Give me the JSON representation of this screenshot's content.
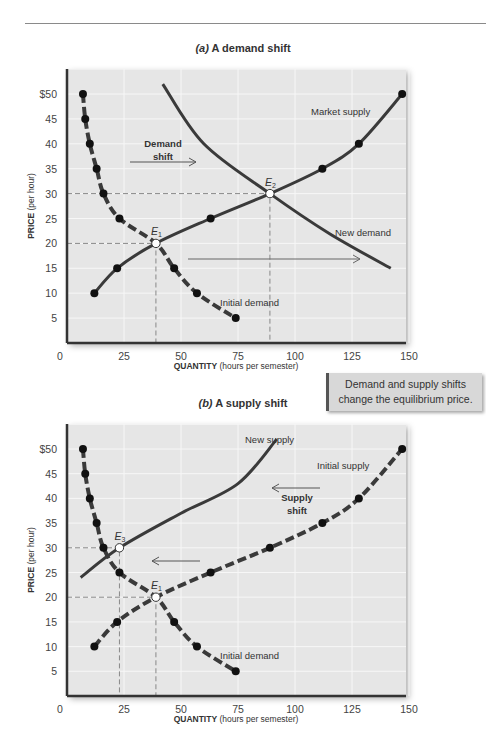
{
  "header": {
    "rule": true
  },
  "callout": {
    "line1": "Demand and supply shifts",
    "line2": "change the equilibrium price."
  },
  "panel_a": {
    "title_prefix": "(a)",
    "title": "A demand shift",
    "ylabel_bold": "PRICE",
    "ylabel_rest": "(per hour)",
    "xlabel_bold": "QUANTITY",
    "xlabel_rest": "(hours per semester)",
    "labels": {
      "market_supply": "Market supply",
      "new_demand": "New demand",
      "initial_demand": "Initial demand",
      "demand_shift_1": "Demand",
      "demand_shift_2": "shift",
      "e1": "E",
      "e1_sub": "1",
      "e2": "E",
      "e2_sub": "2"
    }
  },
  "panel_b": {
    "title_prefix": "(b)",
    "title": "A supply shift",
    "ylabel_bold": "PRICE",
    "ylabel_rest": "(per hour)",
    "xlabel_bold": "QUANTITY",
    "xlabel_rest": "(hours per semester)",
    "labels": {
      "new_supply": "New supply",
      "initial_supply": "Initial supply",
      "initial_demand": "Initial demand",
      "supply_shift_1": "Supply",
      "supply_shift_2": "shift",
      "e1": "E",
      "e1_sub": "1",
      "e3": "E",
      "e3_sub": "3"
    }
  },
  "axis": {
    "x_ticks": [
      "0",
      "25",
      "50",
      "75",
      "100",
      "125",
      "150"
    ],
    "y_ticks": [
      "$50",
      "45",
      "40",
      "35",
      "30",
      "25",
      "20",
      "15",
      "10",
      "5"
    ]
  },
  "colors": {
    "plot_bg": "#e6e6e6",
    "grid": "#f7f7f7",
    "curve": "#3a3a3a",
    "axis": "#333333",
    "guide": "#888888",
    "callout_bg": "#d8d8d8"
  },
  "chart_data": [
    {
      "type": "line",
      "title": "(a) A demand shift",
      "xlabel": "QUANTITY (hours per semester)",
      "ylabel": "PRICE (per hour)",
      "xlim": [
        0,
        150
      ],
      "ylim": [
        0,
        50
      ],
      "grid": true,
      "series": [
        {
          "name": "Initial demand",
          "style": "dashed",
          "points": [
            [
              7,
              50
            ],
            [
              8,
              45
            ],
            [
              10,
              40
            ],
            [
              13,
              35
            ],
            [
              16,
              30
            ],
            [
              23,
              25
            ],
            [
              39,
              20
            ],
            [
              47,
              15
            ],
            [
              57,
              10
            ],
            [
              74,
              5
            ]
          ]
        },
        {
          "name": "Market supply",
          "style": "solid",
          "points": [
            [
              12,
              10
            ],
            [
              22,
              15
            ],
            [
              39,
              20
            ],
            [
              63,
              25
            ],
            [
              89,
              30
            ],
            [
              112,
              35
            ],
            [
              128,
              40
            ],
            [
              147,
              50
            ]
          ]
        },
        {
          "name": "New demand",
          "style": "solid",
          "points": [
            [
              42,
              52
            ],
            [
              60,
              40
            ],
            [
              89,
              30
            ],
            [
              115,
              22
            ],
            [
              142,
              15
            ]
          ]
        }
      ],
      "annotations": [
        {
          "label": "E1",
          "x": 39,
          "y": 20
        },
        {
          "label": "E2",
          "x": 89,
          "y": 30
        },
        {
          "label": "Demand shift",
          "arrow": "right"
        }
      ]
    },
    {
      "type": "line",
      "title": "(b) A supply shift",
      "xlabel": "QUANTITY (hours per semester)",
      "ylabel": "PRICE (per hour)",
      "xlim": [
        0,
        150
      ],
      "ylim": [
        0,
        50
      ],
      "grid": true,
      "series": [
        {
          "name": "Initial demand",
          "style": "dashed",
          "points": [
            [
              7,
              50
            ],
            [
              8,
              45
            ],
            [
              10,
              40
            ],
            [
              13,
              35
            ],
            [
              16,
              30
            ],
            [
              23,
              25
            ],
            [
              39,
              20
            ],
            [
              47,
              15
            ],
            [
              57,
              10
            ],
            [
              74,
              5
            ]
          ]
        },
        {
          "name": "Initial supply",
          "style": "dashed",
          "points": [
            [
              12,
              10
            ],
            [
              22,
              15
            ],
            [
              39,
              20
            ],
            [
              63,
              25
            ],
            [
              89,
              30
            ],
            [
              112,
              35
            ],
            [
              128,
              40
            ],
            [
              147,
              50
            ]
          ]
        },
        {
          "name": "New supply",
          "style": "solid",
          "points": [
            [
              6,
              24
            ],
            [
              23,
              30
            ],
            [
              50,
              37
            ],
            [
              75,
              43
            ],
            [
              92,
              52
            ]
          ]
        }
      ],
      "annotations": [
        {
          "label": "E1",
          "x": 39,
          "y": 20
        },
        {
          "label": "E3",
          "x": 23,
          "y": 30
        },
        {
          "label": "Supply shift",
          "arrow": "left"
        }
      ]
    }
  ]
}
